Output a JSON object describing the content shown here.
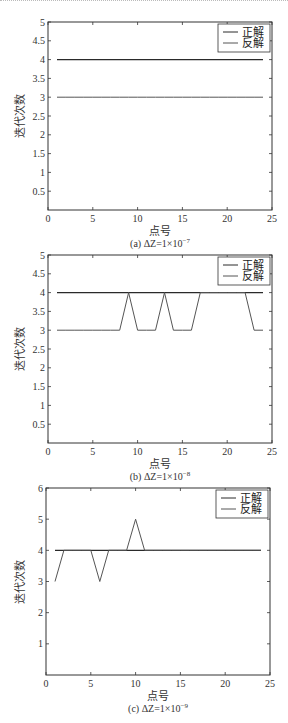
{
  "chart_data": [
    {
      "type": "line",
      "id": "a",
      "caption": "(a) ΔZ=1×10",
      "caption_exp": "−7",
      "xlabel": "点号",
      "ylabel": "迭代次数",
      "xlim": [
        0,
        25
      ],
      "ylim": [
        0,
        5
      ],
      "xticks": [
        0,
        5,
        10,
        15,
        20,
        25
      ],
      "yticks": [
        0.5,
        1,
        1.5,
        2,
        2.5,
        3,
        3.5,
        4,
        4.5,
        5
      ],
      "grid": false,
      "legend_position": "upper right",
      "x": [
        1,
        2,
        3,
        4,
        5,
        6,
        7,
        8,
        9,
        10,
        11,
        12,
        13,
        14,
        15,
        16,
        17,
        18,
        19,
        20,
        21,
        22,
        23,
        24
      ],
      "series": [
        {
          "name": "正解",
          "values": [
            4,
            4,
            4,
            4,
            4,
            4,
            4,
            4,
            4,
            4,
            4,
            4,
            4,
            4,
            4,
            4,
            4,
            4,
            4,
            4,
            4,
            4,
            4,
            4
          ]
        },
        {
          "name": "反解",
          "values": [
            3,
            3,
            3,
            3,
            3,
            3,
            3,
            3,
            3,
            3,
            3,
            3,
            3,
            3,
            3,
            3,
            3,
            3,
            3,
            3,
            3,
            3,
            3,
            3
          ]
        }
      ]
    },
    {
      "type": "line",
      "id": "b",
      "caption": "(b) ΔZ=1×10",
      "caption_exp": "−8",
      "xlabel": "点号",
      "ylabel": "迭代次数",
      "xlim": [
        0,
        25
      ],
      "ylim": [
        0,
        5
      ],
      "xticks": [
        0,
        5,
        10,
        15,
        20,
        25
      ],
      "yticks": [
        0.5,
        1,
        1.5,
        2,
        2.5,
        3,
        3.5,
        4,
        4.5,
        5
      ],
      "grid": false,
      "legend_position": "upper right",
      "x": [
        1,
        2,
        3,
        4,
        5,
        6,
        7,
        8,
        9,
        10,
        11,
        12,
        13,
        14,
        15,
        16,
        17,
        18,
        19,
        20,
        21,
        22,
        23,
        24
      ],
      "series": [
        {
          "name": "正解",
          "values": [
            4,
            4,
            4,
            4,
            4,
            4,
            4,
            4,
            4,
            4,
            4,
            4,
            4,
            4,
            4,
            4,
            4,
            4,
            4,
            4,
            4,
            4,
            4,
            4
          ]
        },
        {
          "name": "反解",
          "values": [
            3,
            3,
            3,
            3,
            3,
            3,
            3,
            3,
            4,
            3,
            3,
            3,
            4,
            3,
            3,
            3,
            4,
            4,
            4,
            4,
            4,
            4,
            3,
            3
          ]
        }
      ]
    },
    {
      "type": "line",
      "id": "c",
      "caption": "(c) ΔZ=1×10",
      "caption_exp": "−9",
      "xlabel": "点号",
      "ylabel": "迭代次数",
      "xlim": [
        0,
        25
      ],
      "ylim": [
        0,
        6
      ],
      "xticks": [
        0,
        5,
        10,
        15,
        20,
        25
      ],
      "yticks": [
        1,
        2,
        3,
        4,
        5,
        6
      ],
      "grid": false,
      "legend_position": "upper right",
      "x": [
        1,
        2,
        3,
        4,
        5,
        6,
        7,
        8,
        9,
        10,
        11,
        12,
        13,
        14,
        15,
        16,
        17,
        18,
        19,
        20,
        21,
        22,
        23,
        24
      ],
      "series": [
        {
          "name": "正解",
          "values": [
            4,
            4,
            4,
            4,
            4,
            4,
            4,
            4,
            4,
            4,
            4,
            4,
            4,
            4,
            4,
            4,
            4,
            4,
            4,
            4,
            4,
            4,
            4,
            4
          ]
        },
        {
          "name": "反解",
          "values": [
            3,
            4,
            4,
            4,
            4,
            3,
            4,
            4,
            4,
            5,
            4,
            4,
            4,
            4,
            4,
            4,
            4,
            4,
            4,
            4,
            4,
            4,
            4,
            4
          ]
        }
      ]
    }
  ],
  "layout": {
    "frames": [
      {
        "left": 48,
        "top": 22,
        "right": 272,
        "bottom": 210,
        "svg_top": 0
      },
      {
        "left": 48,
        "top": 255,
        "right": 272,
        "bottom": 443,
        "svg_top": 0
      },
      {
        "left": 46,
        "top": 488,
        "right": 270,
        "bottom": 675,
        "svg_top": 0
      }
    ],
    "line_colors": [
      "#2a2a2a",
      "#555555"
    ],
    "legend_labels": [
      "正解",
      "反解"
    ]
  }
}
